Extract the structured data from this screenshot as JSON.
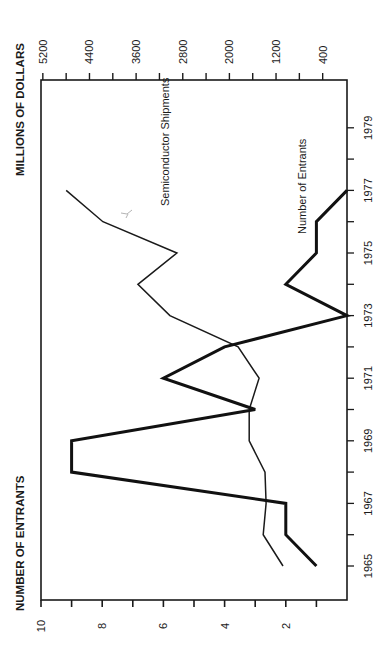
{
  "chart_data": {
    "type": "line",
    "orientation_note_visible": "rotated 90 degrees counterclockwise",
    "title": "",
    "xlabel": "",
    "x": [
      1965,
      1966,
      1967,
      1968,
      1969,
      1970,
      1971,
      1972,
      1973,
      1974,
      1975,
      1976,
      1977
    ],
    "x_ticks": [
      "1965",
      "1967",
      "1969",
      "1971",
      "1973",
      "1975",
      "1977",
      "1979"
    ],
    "x_range": [
      1965,
      1980
    ],
    "y_left": {
      "label": "NUMBER OF ENTRANTS",
      "ticks": [
        "2",
        "4",
        "6",
        "8",
        "10"
      ],
      "range": [
        0,
        10
      ]
    },
    "y_right": {
      "label": "MILLIONS OF DOLLARS",
      "ticks": [
        "400",
        "1200",
        "2000",
        "2800",
        "3600",
        "4400",
        "5200"
      ],
      "range": [
        0,
        5200
      ]
    },
    "series": [
      {
        "name": "Semiconductor Shipments",
        "axis": "right",
        "line_weight": "thin",
        "values": [
          1080,
          1420,
          1370,
          1390,
          1660,
          1660,
          1490,
          1850,
          3020,
          3570,
          2900,
          4170,
          4800
        ]
      },
      {
        "name": "Number of Entrants",
        "axis": "left",
        "line_weight": "thick",
        "values": [
          1,
          2,
          2,
          9,
          9,
          3,
          6,
          4,
          0,
          2,
          1,
          1,
          0
        ]
      }
    ],
    "annotations": [
      "Semiconductor Shipments",
      "Number of Entrants"
    ],
    "grid": false,
    "legend": "inline labels"
  },
  "labels": {
    "left_axis_title": "NUMBER OF ENTRANTS",
    "right_axis_title": "MILLIONS OF DOLLARS",
    "shipments_label": "Semiconductor Shipments",
    "entrants_label": "Number of Entrants"
  }
}
